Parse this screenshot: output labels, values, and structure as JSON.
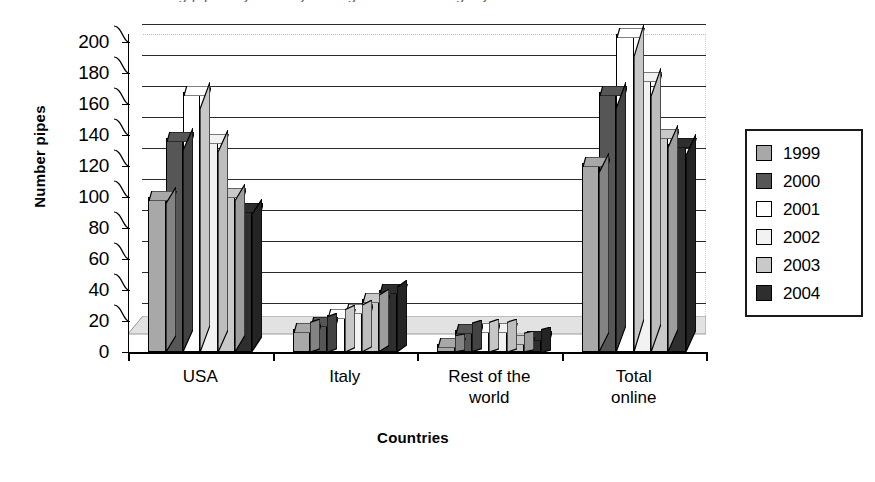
{
  "figure": {
    "caption_remnant": "differentiating pipes by country of origin over the single years of reference",
    "background_color": "#ffffff"
  },
  "chart_data": {
    "type": "bar",
    "title": "",
    "subtitle": "",
    "xlabel": "Countries",
    "ylabel": "Number pipes",
    "categories": [
      "USA",
      "Italy",
      "Rest of the world",
      "Total online"
    ],
    "series": [
      {
        "name": "1999",
        "color": "#a8a8a8",
        "values": [
          100,
          15,
          5,
          122
        ]
      },
      {
        "name": "2000",
        "color": "#565656",
        "values": [
          138,
          19,
          14,
          168
        ]
      },
      {
        "name": "2001",
        "color": "#ffffff",
        "values": [
          168,
          24,
          15,
          205
        ]
      },
      {
        "name": "2002",
        "color": "#f2f2f2",
        "values": [
          137,
          27,
          15,
          177
        ]
      },
      {
        "name": "2003",
        "color": "#c9c9c9",
        "values": [
          102,
          34,
          7,
          140
        ]
      },
      {
        "name": "2004",
        "color": "#2e2e2e",
        "values": [
          92,
          40,
          10,
          134
        ]
      }
    ],
    "ylim": [
      0,
      200
    ],
    "ytick_labels": [
      "0",
      "20",
      "40",
      "60",
      "80",
      "100",
      "120",
      "140",
      "160",
      "180",
      "200"
    ],
    "ytick_values": [
      0,
      20,
      40,
      60,
      80,
      100,
      120,
      140,
      160,
      180,
      200
    ],
    "grid": true,
    "grid_axis": "y",
    "legend_position": "right",
    "legend_entries": [
      "1999",
      "2000",
      "2001",
      "2002",
      "2003",
      "2004"
    ],
    "style": "3d-column",
    "axis_color": "#000000",
    "gridline_color": "#2b2b2b"
  },
  "xtick_labels": [
    {
      "line1": "USA",
      "line2": ""
    },
    {
      "line1": "Italy",
      "line2": ""
    },
    {
      "line1": "Rest of the",
      "line2": "world"
    },
    {
      "line1": "Total",
      "line2": "online"
    }
  ]
}
